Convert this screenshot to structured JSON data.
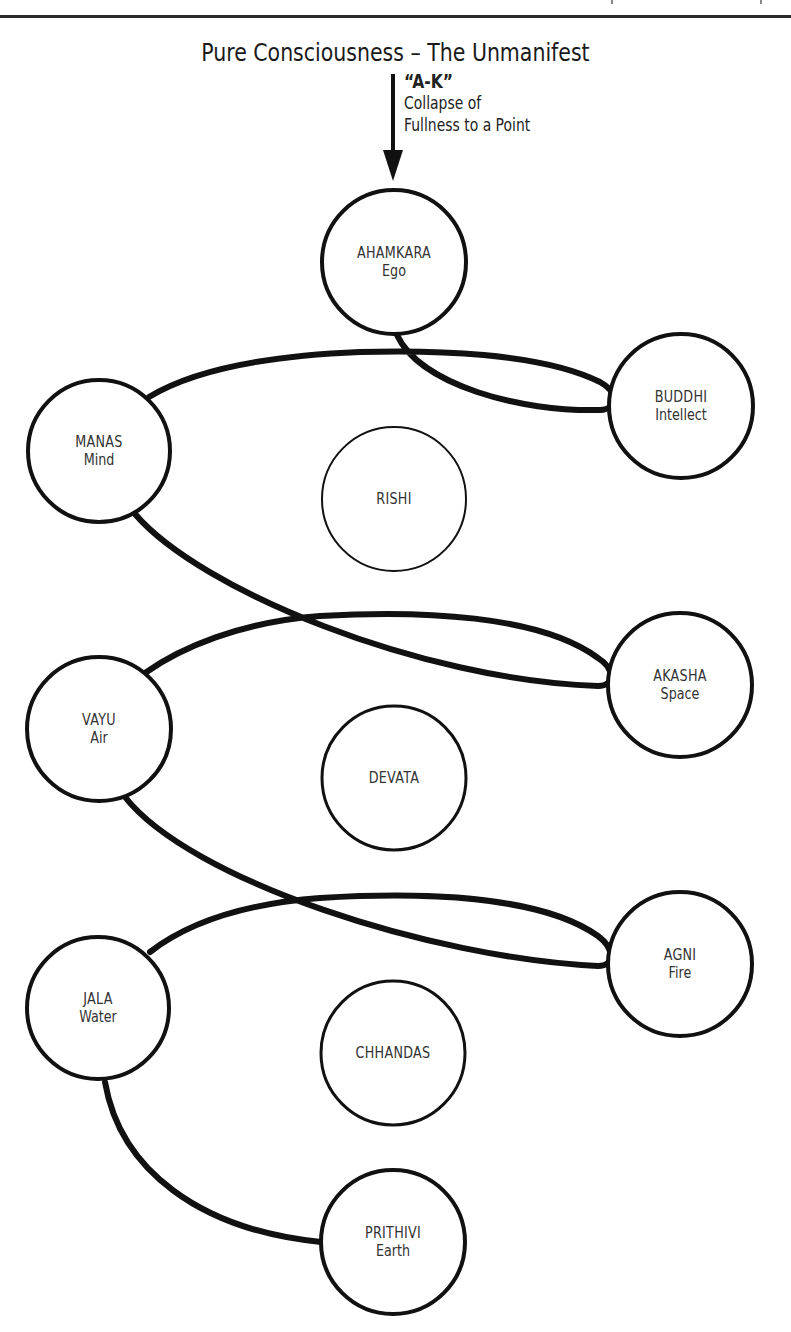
{
  "header": {
    "title": "Pure Consciousness – The Unmanifest",
    "annotation_emphasis": "“A-K”",
    "annotation_line1": "Collapse of",
    "annotation_line2": "Fullness to a Point"
  },
  "colors": {
    "stroke": "#111111",
    "text": "#333333",
    "background": "#ffffff"
  },
  "nodes": [
    {
      "id": "ahamkara",
      "name": "AHAMKARA",
      "sub": "Ego",
      "cx": 394,
      "cy": 262,
      "r": 72,
      "stroke_width": 4
    },
    {
      "id": "buddhi",
      "name": "BUDDHI",
      "sub": "Intellect",
      "cx": 681,
      "cy": 406,
      "r": 72,
      "stroke_width": 4
    },
    {
      "id": "manas",
      "name": "MANAS",
      "sub": "Mind",
      "cx": 99,
      "cy": 451,
      "r": 71,
      "stroke_width": 4
    },
    {
      "id": "rishi",
      "name": "RISHI",
      "sub": "",
      "cx": 394,
      "cy": 499,
      "r": 72,
      "stroke_width": 2
    },
    {
      "id": "akasha",
      "name": "AKASHA",
      "sub": "Space",
      "cx": 680,
      "cy": 685,
      "r": 72,
      "stroke_width": 4
    },
    {
      "id": "vayu",
      "name": "VAYU",
      "sub": "Air",
      "cx": 99,
      "cy": 729,
      "r": 72,
      "stroke_width": 4
    },
    {
      "id": "devata",
      "name": "DEVATA",
      "sub": "",
      "cx": 394,
      "cy": 778,
      "r": 72,
      "stroke_width": 3
    },
    {
      "id": "agni",
      "name": "AGNI",
      "sub": "Fire",
      "cx": 680,
      "cy": 964,
      "r": 72,
      "stroke_width": 4
    },
    {
      "id": "jala",
      "name": "JALA",
      "sub": "Water",
      "cx": 98,
      "cy": 1008,
      "r": 71,
      "stroke_width": 4
    },
    {
      "id": "chhandas",
      "name": "CHHANDAS",
      "sub": "",
      "cx": 393,
      "cy": 1053,
      "r": 72,
      "stroke_width": 3
    },
    {
      "id": "prithivi",
      "name": "PRITHIVI",
      "sub": "Earth",
      "cx": 393,
      "cy": 1242,
      "r": 72,
      "stroke_width": 4
    }
  ],
  "edges": [
    {
      "from": "pure-consciousness",
      "to": "ahamkara",
      "type": "arrow"
    },
    {
      "from": "ahamkara",
      "to": "buddhi",
      "type": "loop"
    },
    {
      "from": "buddhi",
      "to": "manas",
      "type": "curve"
    },
    {
      "from": "manas",
      "to": "akasha",
      "type": "loop"
    },
    {
      "from": "akasha",
      "to": "vayu",
      "type": "curve"
    },
    {
      "from": "vayu",
      "to": "agni",
      "type": "loop"
    },
    {
      "from": "agni",
      "to": "jala",
      "type": "curve"
    },
    {
      "from": "jala",
      "to": "prithivi",
      "type": "curve"
    }
  ]
}
